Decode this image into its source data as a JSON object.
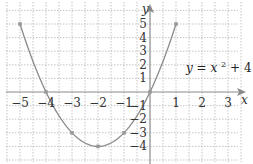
{
  "chart_data": {
    "type": "line",
    "title": "",
    "xlabel": "x",
    "ylabel": "y",
    "xlim": [
      -5.5,
      3.5
    ],
    "ylim": [
      -4.5,
      5.5
    ],
    "grid": true,
    "grid_style": "dotted",
    "legend": null,
    "x_ticks": [
      -5,
      -4,
      -3,
      -2,
      -1,
      1,
      2,
      3
    ],
    "x_tick_labels": [
      "−5",
      "−4",
      "−3",
      "−2",
      "−1",
      "1",
      "2",
      "3"
    ],
    "y_ticks": [
      -4,
      -3,
      -2,
      -1,
      1,
      2,
      3,
      4,
      5
    ],
    "y_tick_labels": [
      "−4",
      "−3",
      "−2",
      "−1",
      "1",
      "2",
      "3",
      "4",
      "5"
    ],
    "series": [
      {
        "name": "y = x^2 + 4x",
        "function": "x^2 + 4x",
        "x": [
          -5,
          -4,
          -3,
          -2,
          -1,
          0,
          1
        ],
        "values": [
          5,
          0,
          -3,
          -4,
          -3,
          0,
          5
        ],
        "markers": true,
        "color": "#8a8a8a"
      }
    ],
    "annotations": [
      {
        "text": "y = x² + 4x",
        "x": 2,
        "y": 2
      }
    ]
  },
  "labels": {
    "x_axis": "x",
    "y_axis": "y",
    "equation_y": "y",
    "equation_eq": " = ",
    "equation_x": "x",
    "equation_exp": "2",
    "equation_plus": " + 4",
    "equation_x2": "x"
  },
  "colors": {
    "curve": "#8a8a8a",
    "axis": "#8a8a8a",
    "grid": "#b5b5b5",
    "text": "#333333"
  }
}
